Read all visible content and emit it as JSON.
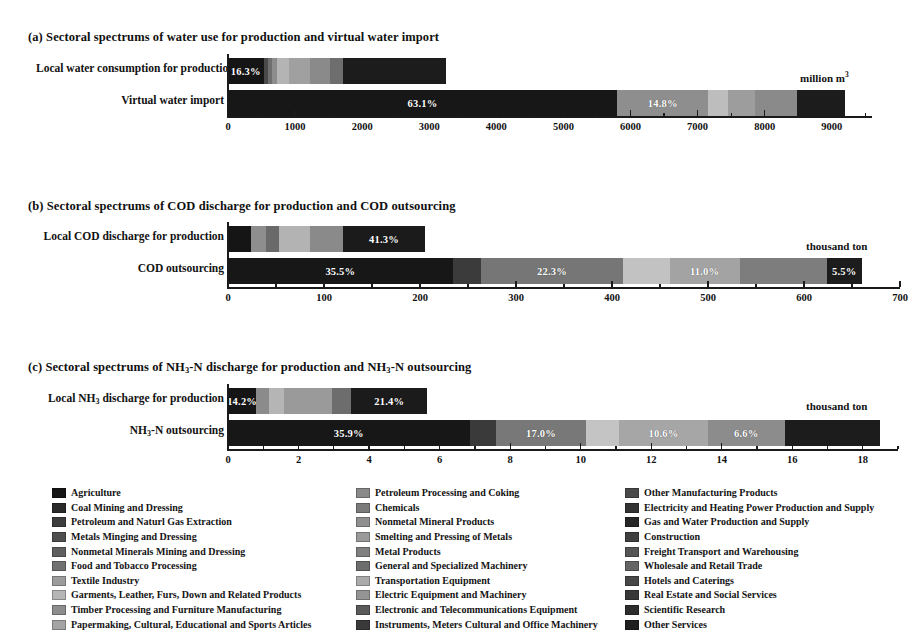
{
  "figure": {
    "unit_water": "million m",
    "unit_water_sup": "3",
    "unit_cod": "thousand ton",
    "unit_nh3": "thousand ton"
  },
  "panels": [
    {
      "id": "panel-a",
      "title_prefix": "(a) Sectoral spectrums of water use for production and virtual water import",
      "unit": "million m",
      "unit_sup": "3",
      "rows": [
        {
          "label": "Local water consumption for production"
        },
        {
          "label": "Virtual water import"
        }
      ]
    },
    {
      "id": "panel-b",
      "title_prefix": "(b) Sectoral spectrums of COD discharge for production and COD outsourcing",
      "unit": "thousand ton",
      "unit_sup": "",
      "rows": [
        {
          "label": "Local COD discharge for production"
        },
        {
          "label": "COD outsourcing"
        }
      ]
    },
    {
      "id": "panel-c",
      "title_prefix": "(c) Sectoral spectrums of  NH",
      "title_sub": "3",
      "title_mid": "-N discharge for production and NH",
      "title_sub2": "3",
      "title_suffix": "-N outsourcing",
      "unit": "thousand ton",
      "unit_sup": "",
      "rows": [
        {
          "label_pre": "Local NH",
          "label_sub": "3",
          "label_post": "  discharge for production"
        },
        {
          "label_pre": "NH",
          "label_sub": "3",
          "label_post": "-N outsourcing"
        }
      ]
    }
  ],
  "sectors": [
    {
      "name": "Agriculture",
      "color": "#151515"
    },
    {
      "name": "Coal Mining and Dressing",
      "color": "#2a2a2a"
    },
    {
      "name": "Petroleum and Naturl Gas Extraction",
      "color": "#3d3d3d"
    },
    {
      "name": "Metals Minging and Dressing",
      "color": "#4e4e4e"
    },
    {
      "name": "Nonmetal Minerals Mining and Dressing",
      "color": "#5f5f5f"
    },
    {
      "name": "Food and Tobacco Processing",
      "color": "#717171"
    },
    {
      "name": "Textile Industry",
      "color": "#9c9c9c"
    },
    {
      "name": "Garments, Leather, Furs, Down and Related Products",
      "color": "#b6b6b6"
    },
    {
      "name": "Timber Processing and Furniture Manufacturing",
      "color": "#8d8d8d"
    },
    {
      "name": "Papermaking, Cultural, Educational and Sports Articles",
      "color": "#a4a4a4"
    },
    {
      "name": "Petroleum Processing and Coking",
      "color": "#8a8a8a"
    },
    {
      "name": "Chemicals",
      "color": "#7b7b7b"
    },
    {
      "name": "Nonmetal Mineral Products",
      "color": "#8f8f8f"
    },
    {
      "name": "Smelting and Pressing of Metals",
      "color": "#9a9a9a"
    },
    {
      "name": "Metal Products",
      "color": "#808080"
    },
    {
      "name": "General and Specialized Machinery",
      "color": "#6d6d6d"
    },
    {
      "name": "Transportation Equipment",
      "color": "#ababab"
    },
    {
      "name": "Electric Equipment and Machinery",
      "color": "#949494"
    },
    {
      "name": "Electronic and Telecommunications Equipment",
      "color": "#5a5a5a"
    },
    {
      "name": "Instruments, Meters Cultural and Office Machinery",
      "color": "#3a3a3a"
    },
    {
      "name": "Other Manufacturing Products",
      "color": "#4a4a4a"
    },
    {
      "name": "Electricity and Heating Power Production and Supply",
      "color": "#333333"
    },
    {
      "name": "Gas and Water Production and Supply",
      "color": "#262626"
    },
    {
      "name": "Construction",
      "color": "#3f3f3f"
    },
    {
      "name": "Freight Transport and Warehousing",
      "color": "#555555"
    },
    {
      "name": "Wholesale and Retail Trade",
      "color": "#646464"
    },
    {
      "name": "Hotels and Caterings",
      "color": "#474747"
    },
    {
      "name": "Real Estate and Social Services",
      "color": "#373737"
    },
    {
      "name": "Scientific Research",
      "color": "#2d2d2d"
    },
    {
      "name": "Other Services",
      "color": "#1f1f1f"
    }
  ],
  "legend_columns": [
    {
      "left": 0,
      "start": 0,
      "end": 10
    },
    {
      "left": 304,
      "start": 10,
      "end": 20
    },
    {
      "left": 573,
      "start": 20,
      "end": 30
    }
  ],
  "chart_data": [
    {
      "type": "bar",
      "orientation": "horizontal",
      "stacked": true,
      "id": "a",
      "title": "(a) Sectoral spectrums of water use for production and virtual water import",
      "xlabel": "million m3",
      "ylabel": "",
      "xlim": [
        0,
        9600
      ],
      "xticks": [
        0,
        1000,
        2000,
        3000,
        4000,
        5000,
        6000,
        7000,
        8000,
        9000
      ],
      "xtick_labels": [
        "0",
        "1000",
        "2000",
        "3000",
        "4000",
        "5000",
        "6000",
        "7000",
        "8000",
        "9000"
      ],
      "minor_tick_step": 500,
      "grid": false,
      "legend_position": "bottom",
      "categories": [
        "Local water consumption for production",
        "Virtual water import"
      ],
      "bars": [
        {
          "category": "Local water consumption for production",
          "total": 3250,
          "segments": [
            {
              "sector": "Agriculture",
              "value": 530,
              "percent": "16.3%",
              "show_label": true,
              "color": "#151515"
            },
            {
              "sector": "Coal Mining and Dressing",
              "value": 60,
              "percent": "",
              "show_label": false,
              "color": "#4a4a4a"
            },
            {
              "sector": "Petroleum and Naturl Gas Extraction",
              "value": 70,
              "percent": "",
              "show_label": false,
              "color": "#6f6f6f"
            },
            {
              "sector": "Metals Minging and Dressing",
              "value": 75,
              "percent": "",
              "show_label": false,
              "color": "#8d8d8d"
            },
            {
              "sector": "Nonmetal Minerals Mining and Dressing",
              "value": 175,
              "percent": "",
              "show_label": false,
              "color": "#b4b4b4"
            },
            {
              "sector": "Food and Tobacco Processing",
              "value": 320,
              "percent": "",
              "show_label": false,
              "color": "#a0a0a0"
            },
            {
              "sector": "Textile Industry",
              "value": 290,
              "percent": "",
              "show_label": false,
              "color": "#8a8a8a"
            },
            {
              "sector": "Garments, Leather, Furs, Down and Related Products",
              "value": 190,
              "percent": "",
              "show_label": false,
              "color": "#6e6e6e"
            },
            {
              "sector": "Other Services",
              "value": 1540,
              "percent": "",
              "show_label": false,
              "color": "#1c1c1c"
            }
          ]
        },
        {
          "category": "Virtual water import",
          "total": 9200,
          "segments": [
            {
              "sector": "Agriculture",
              "value": 5800,
              "percent": "63.1%",
              "show_label": true,
              "color": "#171717"
            },
            {
              "sector": "Food and Tobacco Processing",
              "value": 1360,
              "percent": "14.8%",
              "show_label": true,
              "color": "#8e8e8e"
            },
            {
              "sector": "Textile Industry",
              "value": 290,
              "percent": "",
              "show_label": false,
              "color": "#bdbdbd"
            },
            {
              "sector": "Chemicals",
              "value": 400,
              "percent": "",
              "show_label": false,
              "color": "#9d9d9d"
            },
            {
              "sector": "Smelting and Pressing of Metals",
              "value": 640,
              "percent": "",
              "show_label": false,
              "color": "#8a8a8a"
            },
            {
              "sector": "Other Services",
              "value": 710,
              "percent": "",
              "show_label": false,
              "color": "#1c1c1c"
            }
          ]
        }
      ]
    },
    {
      "type": "bar",
      "orientation": "horizontal",
      "stacked": true,
      "id": "b",
      "title": "(b) Sectoral spectrums of COD discharge for production and COD outsourcing",
      "xlabel": "thousand ton",
      "ylabel": "",
      "xlim": [
        0,
        700
      ],
      "xticks": [
        0,
        100,
        200,
        300,
        400,
        500,
        600,
        700
      ],
      "xtick_labels": [
        "0",
        "100",
        "200",
        "300",
        "400",
        "500",
        "600",
        "700"
      ],
      "minor_tick_step": 50,
      "grid": false,
      "legend_position": "bottom",
      "categories": [
        "Local COD discharge for production",
        "COD outsourcing"
      ],
      "bars": [
        {
          "category": "Local COD discharge for production",
          "total": 205,
          "segments": [
            {
              "sector": "Agriculture",
              "value": 24,
              "percent": "",
              "show_label": false,
              "color": "#151515"
            },
            {
              "sector": "Coal Mining and Dressing",
              "value": 16,
              "percent": "",
              "show_label": false,
              "color": "#8e8e8e"
            },
            {
              "sector": "Food and Tobacco Processing",
              "value": 13,
              "percent": "",
              "show_label": false,
              "color": "#6a6a6a"
            },
            {
              "sector": "Textile Industry",
              "value": 32,
              "percent": "",
              "show_label": false,
              "color": "#b3b3b3"
            },
            {
              "sector": "Papermaking, Cultural, Educational and Sports Articles",
              "value": 35,
              "percent": "",
              "show_label": false,
              "color": "#8a8a8a"
            },
            {
              "sector": "Other Services",
              "value": 85,
              "percent": "41.3%",
              "show_label": true,
              "color": "#1b1b1b"
            }
          ]
        },
        {
          "category": "COD outsourcing",
          "total": 660,
          "segments": [
            {
              "sector": "Agriculture",
              "value": 234,
              "percent": "35.5%",
              "show_label": true,
              "color": "#171717"
            },
            {
              "sector": "Food and Tobacco Processing",
              "value": 30,
              "percent": "",
              "show_label": false,
              "color": "#3b3b3b"
            },
            {
              "sector": "Textile Industry",
              "value": 147,
              "percent": "22.3%",
              "show_label": true,
              "color": "#767676"
            },
            {
              "sector": "Garments, Leather, Furs, Down and Related Products",
              "value": 49,
              "percent": "",
              "show_label": false,
              "color": "#c2c2c2"
            },
            {
              "sector": "Papermaking, Cultural, Educational and Sports Articles",
              "value": 73,
              "percent": "11.0%",
              "show_label": true,
              "color": "#a3a3a3"
            },
            {
              "sector": "Chemicals",
              "value": 91,
              "percent": "",
              "show_label": false,
              "color": "#7d7d7d"
            },
            {
              "sector": "Other Services",
              "value": 36,
              "percent": "5.5%",
              "show_label": true,
              "color": "#1c1c1c"
            }
          ]
        }
      ]
    },
    {
      "type": "bar",
      "orientation": "horizontal",
      "stacked": true,
      "id": "c",
      "title": "(c) Sectoral spectrums of NH3-N discharge for production and NH3-N outsourcing",
      "xlabel": "thousand ton",
      "ylabel": "",
      "xlim": [
        0,
        19
      ],
      "xticks": [
        0,
        2,
        4,
        6,
        8,
        10,
        12,
        14,
        16,
        18
      ],
      "xtick_labels": [
        "0",
        "2",
        "4",
        "6",
        "8",
        "10",
        "12",
        "14",
        "16",
        "18"
      ],
      "minor_tick_step": 1,
      "grid": false,
      "legend_position": "bottom",
      "categories": [
        "Local NH3-N discharge for production",
        "NH3-N outsourcing"
      ],
      "bars": [
        {
          "category": "Local NH3-N discharge for production",
          "total": 5.65,
          "segments": [
            {
              "sector": "Agriculture",
              "value": 0.8,
              "percent": "14.2%",
              "show_label": true,
              "color": "#151515"
            },
            {
              "sector": "Coal Mining and Dressing",
              "value": 0.35,
              "percent": "",
              "show_label": false,
              "color": "#8b8b8b"
            },
            {
              "sector": "Food and Tobacco Processing",
              "value": 0.45,
              "percent": "",
              "show_label": false,
              "color": "#b5b5b5"
            },
            {
              "sector": "Textile Industry",
              "value": 1.35,
              "percent": "",
              "show_label": false,
              "color": "#9a9a9a"
            },
            {
              "sector": "Chemicals",
              "value": 0.55,
              "percent": "",
              "show_label": false,
              "color": "#6d6d6d"
            },
            {
              "sector": "Other Services",
              "value": 2.15,
              "percent": "21.4%",
              "show_label": true,
              "color": "#1b1b1b"
            }
          ]
        },
        {
          "category": "NH3-N outsourcing",
          "total": 18.5,
          "segments": [
            {
              "sector": "Agriculture",
              "value": 6.85,
              "percent": "35.9%",
              "show_label": true,
              "color": "#171717"
            },
            {
              "sector": "Food and Tobacco Processing",
              "value": 0.75,
              "percent": "",
              "show_label": false,
              "color": "#3a3a3a"
            },
            {
              "sector": "Textile Industry",
              "value": 2.55,
              "percent": "17.0%",
              "show_label": true,
              "color": "#787878"
            },
            {
              "sector": "Garments, Leather, Furs, Down and Related Products",
              "value": 0.95,
              "percent": "",
              "show_label": false,
              "color": "#c4c4c4"
            },
            {
              "sector": "Papermaking, Cultural, Educational and Sports Articles",
              "value": 2.5,
              "percent": "10.6%",
              "show_label": true,
              "color": "#a6a6a6"
            },
            {
              "sector": "Chemicals",
              "value": 2.2,
              "percent": "6.6%",
              "show_label": true,
              "color": "#8c8c8c"
            },
            {
              "sector": "Other Services",
              "value": 2.7,
              "percent": "",
              "show_label": false,
              "color": "#1c1c1c"
            }
          ]
        }
      ]
    }
  ]
}
